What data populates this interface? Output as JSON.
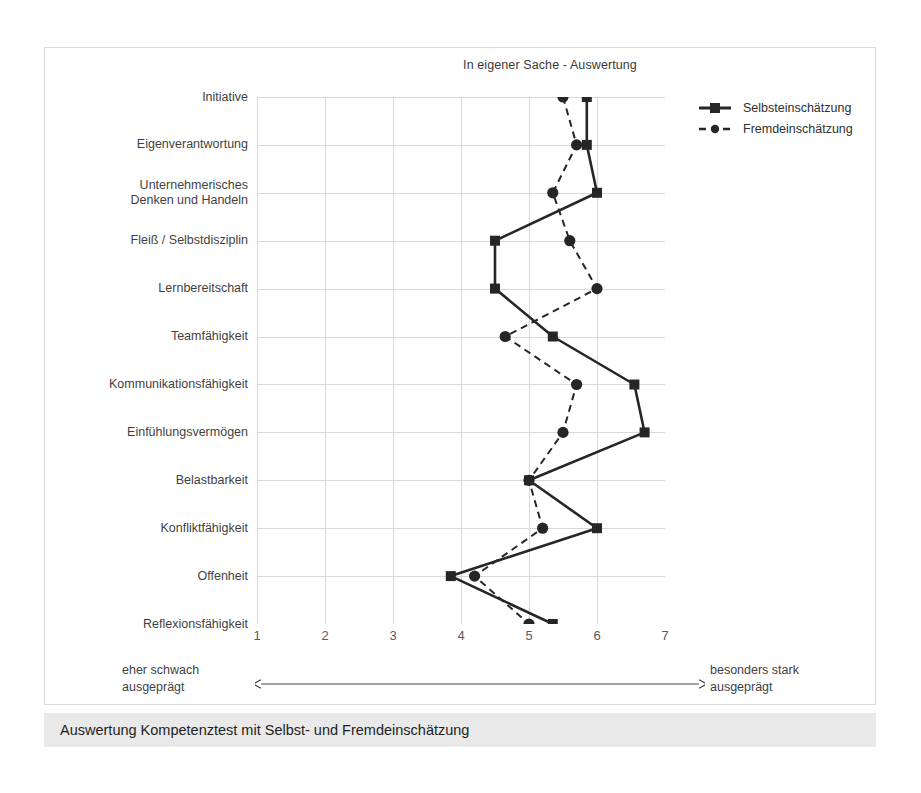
{
  "figure": {
    "title": "In eigener Sache - Auswertung",
    "caption": "Auswertung Kompetenztest mit Selbst- und Fremdeinschätzung",
    "scale_note_left": "eher schwach\nausgeprägt",
    "scale_note_right": "besonders stark\nausgeprägt"
  },
  "legend": {
    "position": "right",
    "items": [
      {
        "label": "Selbsteinschätzung",
        "style": "solid",
        "marker": "square",
        "color": "#262626"
      },
      {
        "label": "Fremdeinschätzung",
        "style": "dashed",
        "marker": "circle",
        "color": "#262626"
      }
    ]
  },
  "chart_data": {
    "type": "line",
    "orientation": "horizontal",
    "title": "In eigener Sache - Auswertung",
    "xlabel": "",
    "ylabel": "",
    "xlim": [
      1,
      7
    ],
    "xticks": [
      1,
      2,
      3,
      4,
      5,
      6,
      7
    ],
    "xtick_labels": [
      "1",
      "2",
      "3",
      "4",
      "5",
      "6",
      "7"
    ],
    "grid": true,
    "categories": [
      "Initiative",
      "Eigenverantwortung",
      "Unternehmerisches\nDenken und Handeln",
      "Fleiß / Selbstdisziplin",
      "Lernbereitschaft",
      "Teamfähigkeit",
      "Kommunikationsfähigkeit",
      "Einfühlungsvermögen",
      "Belastbarkeit",
      "Konfliktfähigkeit",
      "Offenheit",
      "Reflexionsfähigkeit"
    ],
    "series": [
      {
        "name": "Selbsteinschätzung",
        "style": "solid",
        "marker": "square",
        "color": "#262626",
        "values": [
          5.85,
          5.85,
          6.0,
          4.5,
          4.5,
          5.35,
          6.55,
          6.7,
          5.0,
          6.0,
          3.85,
          5.35
        ]
      },
      {
        "name": "Fremdeinschätzung",
        "style": "dashed",
        "marker": "circle",
        "color": "#262626",
        "values": [
          5.5,
          5.7,
          5.35,
          5.6,
          6.0,
          4.65,
          5.7,
          5.5,
          5.0,
          5.2,
          4.2,
          5.0
        ]
      }
    ]
  },
  "colors": {
    "line": "#262626",
    "grid": "#d9d9d9",
    "frame": "#dcdcdc",
    "caption_bg": "#e9e9e9",
    "text": "#3f3f3f"
  }
}
